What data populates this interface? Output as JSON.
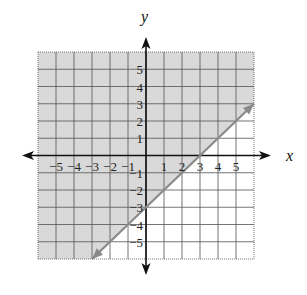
{
  "chart_data": {
    "type": "line",
    "title": "",
    "xlabel": "x",
    "ylabel": "y",
    "xlim": [
      -6,
      6
    ],
    "ylim": [
      -6,
      6
    ],
    "grid": true,
    "x_ticks": [
      "−5",
      "−4",
      "−3",
      "−2",
      "−1",
      "1",
      "2",
      "3",
      "4",
      "5"
    ],
    "y_ticks": [
      "5",
      "4",
      "3",
      "2",
      "1",
      "−1",
      "−2",
      "−3",
      "−4",
      "−5"
    ],
    "series": [
      {
        "name": "boundary line y = x − 3",
        "x": [
          -3,
          6
        ],
        "y": [
          -6,
          3
        ],
        "slope": 1,
        "intercept": -3,
        "style": "solid",
        "arrows": "both"
      }
    ],
    "shaded_region": "above line (y ≥ x − 3)",
    "colors": {
      "shade": "#d9d9d9",
      "line": "#8a8a8a",
      "axis": "#111111",
      "grid": "#555555"
    }
  }
}
